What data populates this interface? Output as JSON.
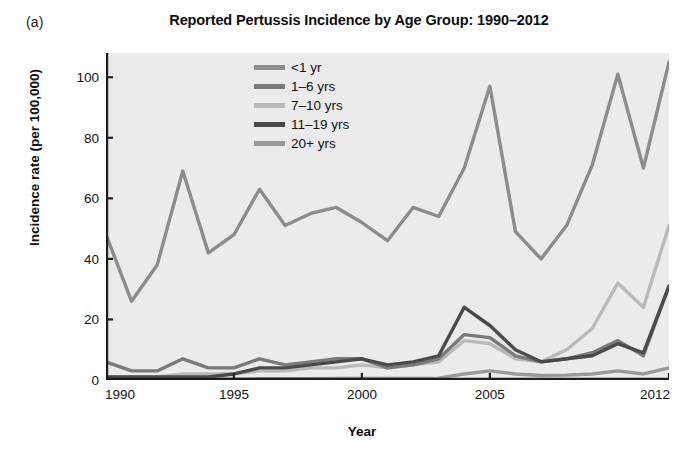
{
  "panel": {
    "label": "(a)"
  },
  "chart_data": {
    "type": "line",
    "title": "Reported Pertussis Incidence by Age Group: 1990–2012",
    "xlabel": "Year",
    "ylabel": "Incidence rate (per 100,000)",
    "xlim": [
      1990,
      2012
    ],
    "ylim": [
      0,
      108
    ],
    "xticks": [
      1990,
      1995,
      2000,
      2005,
      2012
    ],
    "xticklabels": [
      "1990",
      "1995",
      "2000",
      "2005",
      "2012"
    ],
    "yticks": [
      0,
      20,
      40,
      60,
      80,
      100
    ],
    "yticklabels": [
      "0",
      "20",
      "40",
      "60",
      "80",
      "100"
    ],
    "grid": false,
    "legend_position": "upper-center-inside",
    "plot_background": "#ebebeb",
    "x": [
      1990,
      1991,
      1992,
      1993,
      1994,
      1995,
      1996,
      1997,
      1998,
      1999,
      2000,
      2001,
      2002,
      2003,
      2004,
      2005,
      2006,
      2007,
      2008,
      2009,
      2010,
      2011,
      2012
    ],
    "series": [
      {
        "name": "<1 yr",
        "color": "#8c8c8c",
        "values": [
          48,
          26,
          38,
          69,
          42,
          48,
          63,
          51,
          55,
          57,
          52,
          46,
          57,
          54,
          70,
          97,
          49,
          40,
          51,
          71,
          101,
          70,
          105
        ]
      },
      {
        "name": "1–6 yrs",
        "color": "#7a7a7a",
        "values": [
          6,
          3,
          3,
          7,
          4,
          4,
          7,
          5,
          6,
          7,
          7,
          4,
          5,
          7,
          15,
          14,
          8,
          6,
          7,
          9,
          13,
          8,
          31
        ]
      },
      {
        "name": "7–10 yrs",
        "color": "#b9b9b9",
        "values": [
          1,
          1,
          1,
          2,
          2,
          2,
          3,
          3,
          4,
          4,
          5,
          4,
          5,
          6,
          13,
          12,
          7,
          6,
          10,
          17,
          32,
          24,
          51
        ]
      },
      {
        "name": "11–19 yrs",
        "color": "#4a4a4a",
        "values": [
          1,
          1,
          1,
          1,
          1,
          2,
          4,
          4,
          5,
          6,
          7,
          5,
          6,
          8,
          24,
          18,
          10,
          6,
          7,
          8,
          12,
          9,
          31
        ]
      },
      {
        "name": "20+ yrs",
        "color": "#999999",
        "values": [
          0.3,
          0.3,
          0.3,
          0.3,
          0.3,
          0.3,
          0.4,
          0.4,
          0.4,
          0.5,
          0.5,
          0.5,
          0.5,
          0.6,
          2,
          3,
          2,
          1.5,
          1.6,
          2,
          3,
          2,
          4
        ]
      }
    ]
  }
}
